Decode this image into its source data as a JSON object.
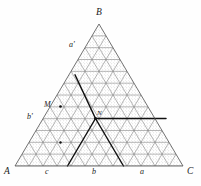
{
  "figure": {
    "type": "diagram",
    "shape": "equilateral-triangle",
    "subdivisions": 12,
    "fill_pattern": "stipple-dots",
    "grid_color": "#7a7a7a",
    "bold_color": "#101010",
    "stipple_color": "#9a9a9a",
    "background": "#fefefe",
    "vertices": {
      "A": {
        "x": 15,
        "y": 166
      },
      "B": {
        "x": 99,
        "y": 24
      },
      "C": {
        "x": 183,
        "y": 166
      }
    },
    "intersection": {
      "x": 95.5,
      "y": 118.5,
      "label": "N"
    },
    "point_M": {
      "x": 60.5,
      "y": 106.5
    },
    "bold_paths": [
      {
        "name": "upper-left-diagonal",
        "from": [
          75.0,
          74.8
        ],
        "to": [
          95.5,
          118.5
        ]
      },
      {
        "name": "lower-left-diagonal",
        "from": [
          95.5,
          118.5
        ],
        "to": [
          67.5,
          166.0
        ]
      },
      {
        "name": "lower-right-diagonal",
        "from": [
          95.5,
          118.5
        ],
        "to": [
          123.5,
          166.0
        ]
      },
      {
        "name": "horizontal-right",
        "from": [
          95.5,
          118.5
        ],
        "to": [
          166.0,
          118.5
        ]
      }
    ]
  },
  "labels": {
    "vertex_top": "B",
    "vertex_left": "A",
    "vertex_right": "C",
    "base_left": "c",
    "base_mid": "b",
    "base_right": "a",
    "upper_left": "a'",
    "mid_left": "b'",
    "point_m": "M",
    "point_n": "N"
  },
  "chart_data": {
    "type": "diagram",
    "title": ""
  }
}
